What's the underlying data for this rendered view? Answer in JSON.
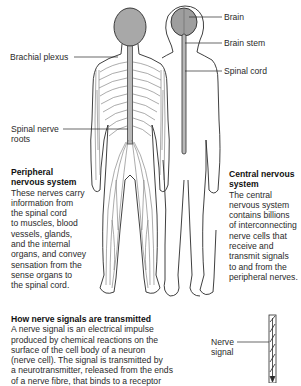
{
  "labels": {
    "brain": "Brain",
    "brain_stem": "Brain stem",
    "spinal_cord": "Spinal cord",
    "brachial_plexus": "Brachial plexus",
    "spinal_nerve_roots": "Spinal nerve\nroots",
    "nerve_signal": "Nerve\nsignal"
  },
  "peripheral": {
    "title": "Peripheral\nnervous system",
    "body": "These nerves carry\ninformation from\nthe spinal cord\nto muscles, blood\nvessels, glands,\nand the internal\norgans, and convey\nsensation from the\nsense organs to\nthe spinal cord."
  },
  "central": {
    "title": "Central nervous\nsystem",
    "body": "The central\nnervous system\ncontains billions\nof interconnecting\nnerve cells that\nreceive and\ntransmit signals\nto and from the\nperipheral nerves."
  },
  "transmission": {
    "title": "How nerve signals are transmitted",
    "body": "A nerve signal is an electrical impulse\nproduced by chemical reactions on the\nsurface of the cell body of a neuron\n(nerve cell). The signal is transmitted by\na neurotransmitter, released from the ends\nof a nerve fibre, that binds to a receptor"
  },
  "colors": {
    "outline": "#2a2a2a",
    "brain_fill": "#a8a8a8",
    "spine_fill": "#b8b8b8",
    "text": "#2a2a2a"
  }
}
